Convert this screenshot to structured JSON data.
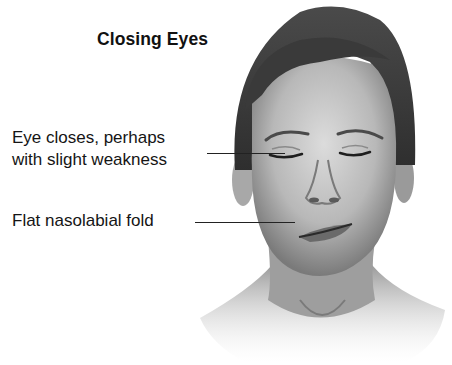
{
  "figure": {
    "title": "Closing Eyes",
    "labels": [
      {
        "id": "eye",
        "lines": [
          "Eye closes, perhaps",
          "with slight weakness"
        ]
      },
      {
        "id": "fold",
        "lines": [
          "Flat nasolabial fold"
        ]
      }
    ]
  }
}
